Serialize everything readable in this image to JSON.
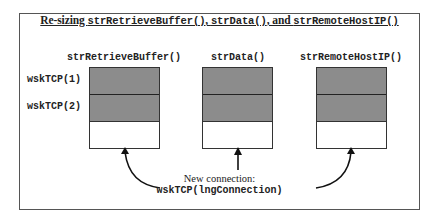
{
  "diagram": {
    "title_parts": [
      "Re-sizing ",
      "strRetrieveBuffer()",
      ", ",
      "strData()",
      ", and ",
      "strRemoteHostIP()"
    ],
    "columns": [
      {
        "label": "strRetrieveBuffer()",
        "slots": [
          "filled",
          "filled",
          "new"
        ]
      },
      {
        "label": "strData()",
        "slots": [
          "filled",
          "filled",
          "new"
        ]
      },
      {
        "label": "strRemoteHostIP()",
        "slots": [
          "filled",
          "filled",
          "new"
        ]
      }
    ],
    "row_labels": [
      "wskTCP(1)",
      "wskTCP(2)"
    ],
    "caption_line1": "New connection:",
    "caption_line2": "wskTCP(lngConnection)",
    "colors": {
      "filled": "#8c8c8c",
      "empty": "#ffffff",
      "border": "#333333"
    }
  }
}
